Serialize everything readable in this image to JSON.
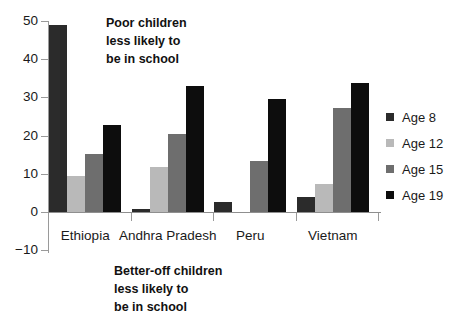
{
  "chart_data": {
    "type": "bar",
    "title": "",
    "subtitle": "",
    "xlabel": "",
    "ylabel": "",
    "categories": [
      "Ethiopia",
      "Andhra Pradesh",
      "Peru",
      "Vietnam"
    ],
    "series": [
      {
        "name": "Age 8",
        "color": "#2b2b2b",
        "values": [
          49.0,
          0.7,
          2.7,
          3.9
        ]
      },
      {
        "name": "Age 12",
        "color": "#b9b9b9",
        "values": [
          9.3,
          11.7,
          0.0,
          7.3
        ]
      },
      {
        "name": "Age 15",
        "color": "#6e6e6e",
        "values": [
          15.2,
          20.3,
          13.3,
          27.2
        ]
      },
      {
        "name": "Age 19",
        "color": "#0d0d0d",
        "values": [
          22.9,
          32.9,
          29.5,
          33.7
        ]
      }
    ],
    "ylim": [
      -10,
      50
    ],
    "yticks": [
      -10,
      0,
      10,
      20,
      30,
      40,
      50
    ],
    "ytick_labels": [
      "−10",
      "0",
      "10",
      "20",
      "30",
      "40",
      "50"
    ],
    "grid": false,
    "legend_position": "right",
    "annotations": [
      {
        "id": "top",
        "lines": [
          "Poor children",
          "less likely to",
          "be in school"
        ]
      },
      {
        "id": "bottom",
        "lines": [
          "Better-off children",
          "less likely to",
          "be in school"
        ]
      }
    ]
  },
  "legend": {
    "entries": [
      {
        "label": "Age 8",
        "color": "#2b2b2b"
      },
      {
        "label": "Age 12",
        "color": "#b9b9b9"
      },
      {
        "label": "Age 15",
        "color": "#6e6e6e"
      },
      {
        "label": "Age 19",
        "color": "#0d0d0d"
      }
    ]
  },
  "axis": {
    "y_labels": [
      "50",
      "40",
      "30",
      "20",
      "10",
      "0",
      "−10"
    ]
  }
}
